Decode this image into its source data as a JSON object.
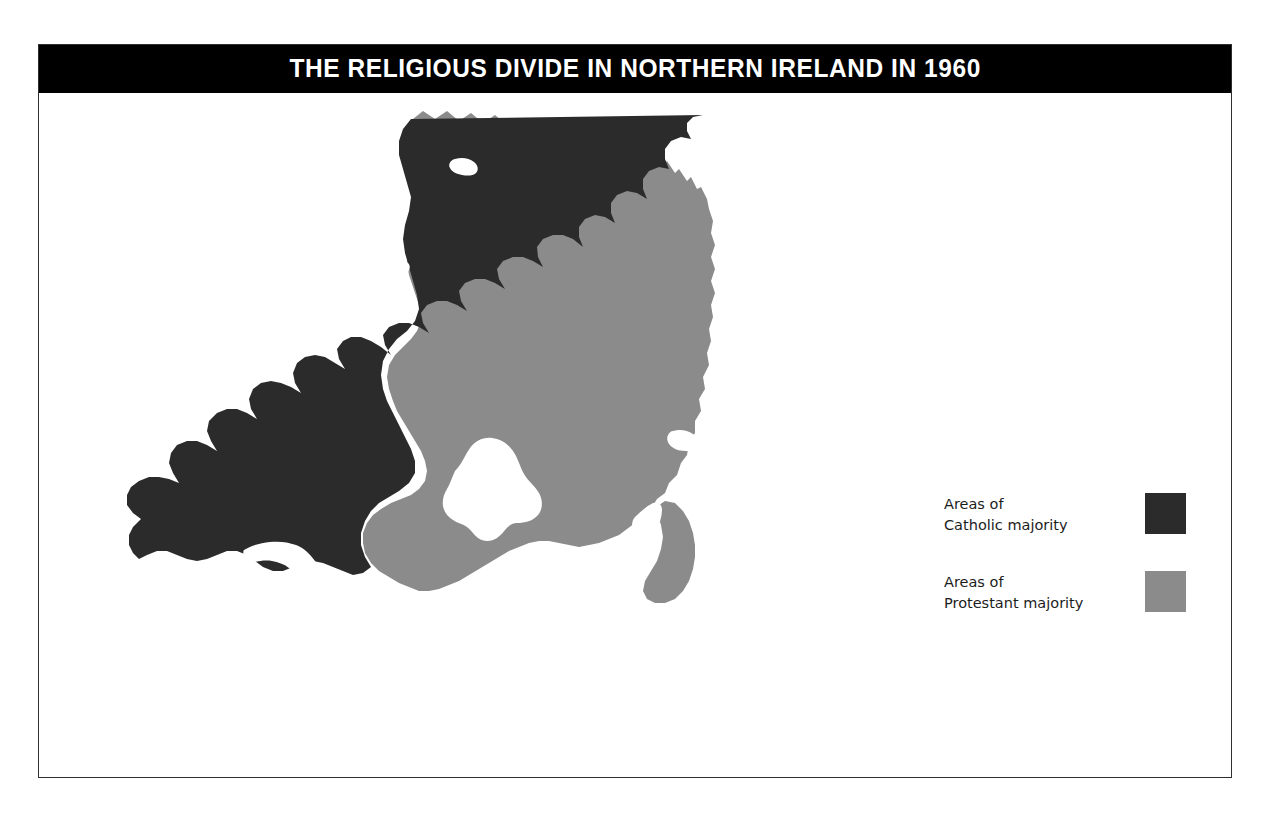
{
  "figure": {
    "title": "THE RELIGIOUS DIVIDE IN NORTHERN IRELAND IN 1960",
    "kind": "choropleth-map",
    "subject": "Northern Ireland",
    "year": "1960"
  },
  "colors": {
    "catholic_majority": "#2b2b2b",
    "protestant_majority": "#8b8b8b",
    "water": "#ffffff",
    "background": "#ffffff",
    "banner_background": "#000000",
    "banner_text": "#ffffff",
    "frame_border": "#2f2f2f",
    "legend_text": "#1c1c1c"
  },
  "legend": {
    "items": [
      {
        "label": "Areas of\nCatholic majority",
        "line1": "Areas of",
        "line2": "Catholic majority",
        "swatch_color": "#2b2b2b",
        "swatch_name": "catholic-majority-swatch"
      },
      {
        "label": "Areas of\nProtestant majority",
        "line1": "Areas of",
        "line2": "Protestant majority",
        "swatch_color": "#8b8b8b",
        "swatch_name": "protestant-majority-swatch"
      }
    ]
  },
  "map_regions": [
    {
      "name": "catholic-majority-region",
      "category": "Catholic majority",
      "fill": "#2b2b2b"
    },
    {
      "name": "protestant-majority-region",
      "category": "Protestant majority",
      "fill": "#8b8b8b"
    },
    {
      "name": "lough-neagh",
      "category": "water",
      "fill": "#ffffff"
    },
    {
      "name": "strangford-lough",
      "category": "water",
      "fill": "#ffffff"
    },
    {
      "name": "lough-erne",
      "category": "water",
      "fill": "#ffffff"
    },
    {
      "name": "lough-foyle",
      "category": "water",
      "fill": "#ffffff"
    },
    {
      "name": "belfast-lough",
      "category": "water",
      "fill": "#ffffff"
    },
    {
      "name": "bann-estuary",
      "category": "water",
      "fill": "#ffffff"
    },
    {
      "name": "carlingford-lough",
      "category": "water",
      "fill": "#ffffff"
    }
  ]
}
